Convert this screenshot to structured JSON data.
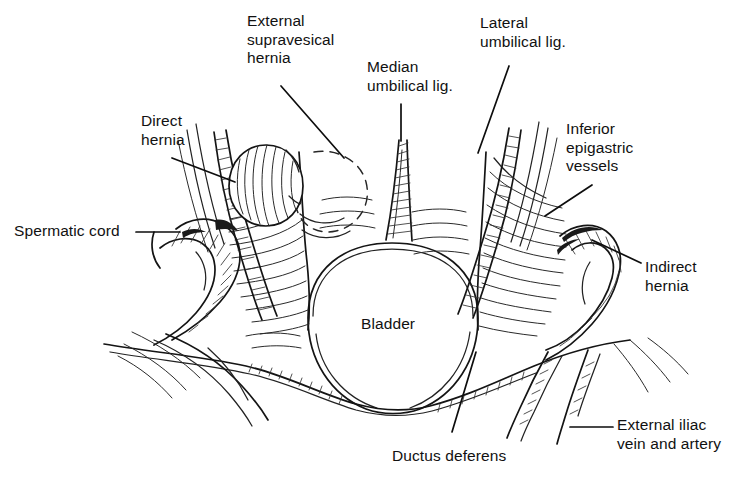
{
  "figure": {
    "background_color": "#ffffff",
    "ink_color": "#111111",
    "width": 733,
    "height": 479
  },
  "labels": [
    {
      "id": "external-supravesical-hernia",
      "text": "External\nsupravesical\nhernia",
      "x": 247,
      "y": 12,
      "align": "left"
    },
    {
      "id": "median-umbilical-lig",
      "text": "Median\numbilical lig.",
      "x": 367,
      "y": 58,
      "align": "left"
    },
    {
      "id": "lateral-umbilical-lig",
      "text": "Lateral\numbilical lig.",
      "x": 480,
      "y": 14,
      "align": "left"
    },
    {
      "id": "direct-hernia",
      "text": "Direct\nhernia",
      "x": 141,
      "y": 112,
      "align": "left"
    },
    {
      "id": "inferior-epigastric-vessels",
      "text": "Inferior\nepigastric\nvessels",
      "x": 566,
      "y": 120,
      "align": "left"
    },
    {
      "id": "spermatic-cord",
      "text": "Spermatic cord",
      "x": 14,
      "y": 222,
      "align": "left"
    },
    {
      "id": "indirect-hernia",
      "text": "Indirect\nhernia",
      "x": 645,
      "y": 258,
      "align": "left"
    },
    {
      "id": "bladder",
      "text": "Bladder",
      "x": 361,
      "y": 315,
      "align": "left"
    },
    {
      "id": "ductus-deferens",
      "text": "Ductus deferens",
      "x": 392,
      "y": 447,
      "align": "left"
    },
    {
      "id": "external-iliac-vein-and-artery",
      "text": "External iliac\nvein and artery",
      "x": 617,
      "y": 416,
      "align": "left"
    }
  ],
  "leader_lines": [
    {
      "id": "leader-external-supravesical-hernia",
      "from": [
        281,
        86
      ],
      "to": [
        344,
        158
      ]
    },
    {
      "id": "leader-median-umbilical-lig",
      "from": [
        401,
        104
      ],
      "to": [
        401,
        141
      ]
    },
    {
      "id": "leader-lateral-umbilical-lig",
      "from": [
        509,
        66
      ],
      "to": [
        478,
        153
      ]
    },
    {
      "id": "leader-direct-hernia",
      "from": [
        172,
        158
      ],
      "to": [
        235,
        182
      ]
    },
    {
      "id": "leader-inferior-epigastric-vessels",
      "from": [
        592,
        185
      ],
      "to": [
        545,
        216
      ]
    },
    {
      "id": "leader-spermatic-cord",
      "from": [
        136,
        232
      ],
      "to": [
        180,
        232
      ]
    },
    {
      "id": "leader-indirect-hernia",
      "from": [
        641,
        263
      ],
      "to": [
        592,
        240
      ]
    },
    {
      "id": "leader-ductus-deferens",
      "from": [
        452,
        432
      ],
      "to": [
        476,
        352
      ]
    },
    {
      "id": "leader-external-iliac",
      "from": [
        570,
        427
      ],
      "to": [
        613,
        427
      ]
    }
  ],
  "anatomy": {
    "structures": [
      "bladder",
      "median-umbilical-ligament",
      "left-medial-umbilical-ligament",
      "right-medial-umbilical-ligament",
      "left-lateral-umbilical-ligament",
      "right-lateral-umbilical-ligament",
      "left-inferior-epigastric-vessels",
      "right-inferior-epigastric-vessels",
      "left-spermatic-cord",
      "right-spermatic-cord",
      "left-direct-hernia-bulge",
      "right-indirect-hernia-bulge",
      "external-supravesical-hernia-outline",
      "left-ductus-deferens",
      "right-ductus-deferens",
      "external-iliac-vein-and-artery",
      "peritoneal-fold-left",
      "peritoneal-fold-right"
    ],
    "style": "pen-and-ink line drawing with hatched shading",
    "supravesical_hernia_outline": "dashed"
  }
}
